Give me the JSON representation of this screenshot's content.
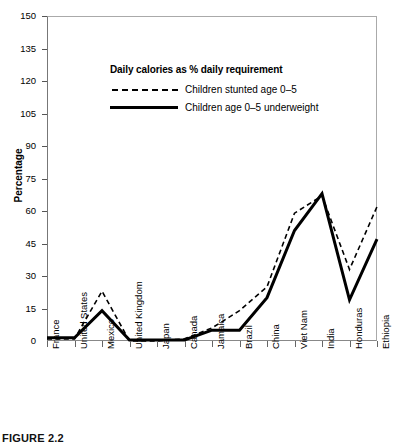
{
  "chart_data": {
    "type": "line",
    "title": "",
    "xlabel": "",
    "ylabel": "Percentage",
    "ylim": [
      0,
      150
    ],
    "yticks": [
      0,
      15,
      30,
      45,
      60,
      75,
      90,
      105,
      120,
      135,
      150
    ],
    "grid": false,
    "legend_position": "upper-left-inside",
    "legend_title": "Daily calories as % daily requirement",
    "categories": [
      "France",
      "United States",
      "Mexico",
      "United Kingdom",
      "Japan",
      "Canada",
      "Jamaica",
      "Brazil",
      "China",
      "Viet Nam",
      "India",
      "Honduras",
      "Ethiopia"
    ],
    "series": [
      {
        "name": "Children stunted age 0–5",
        "style": "dashed",
        "color": "#000000",
        "values": [
          1,
          1,
          23,
          0,
          0,
          1,
          6,
          14,
          25,
          59,
          67,
          33,
          62
        ]
      },
      {
        "name": "Children age 0–5 underweight",
        "style": "solid",
        "color": "#000000",
        "values": [
          1.5,
          1.5,
          14,
          0.5,
          0.5,
          0.5,
          5,
          5,
          20,
          51,
          68,
          19,
          47
        ]
      }
    ]
  },
  "legend": {
    "title": "Daily calories as % daily requirement",
    "entries": [
      {
        "label": "Children stunted age 0–5",
        "style": "dashed"
      },
      {
        "label": "Children age 0–5 underweight",
        "style": "solid"
      }
    ]
  },
  "axes": {
    "y_title": "Percentage",
    "y_ticks": [
      "150",
      "135",
      "120",
      "105",
      "90",
      "75",
      "60",
      "45",
      "30",
      "15",
      "0"
    ],
    "x_ticks": [
      "France",
      "United States",
      "Mexico",
      "United Kingdom",
      "Japan",
      "Canada",
      "Jamaica",
      "Brazil",
      "China",
      "Viet Nam",
      "India",
      "Honduras",
      "Ethiopia"
    ]
  },
  "caption": {
    "label": "FIGURE 2.2",
    "text": ""
  }
}
